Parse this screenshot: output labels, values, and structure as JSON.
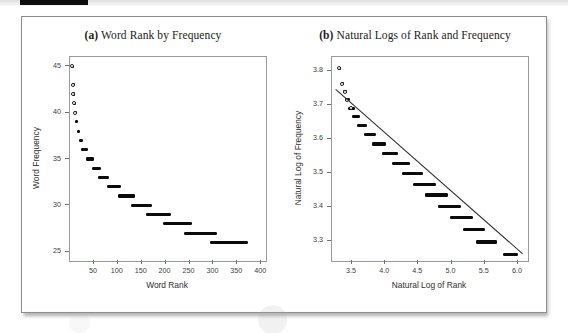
{
  "figure": {
    "panels": [
      {
        "tag": "(a)",
        "title": "Word Rank by Frequency"
      },
      {
        "tag": "(b)",
        "title": "Natural Logs of Rank and Frequency"
      }
    ]
  },
  "chart_data": [
    {
      "type": "scatter",
      "panel": "a",
      "title": "(a) Word Rank by Frequency",
      "xlabel": "Word Rank",
      "ylabel": "Word Frequency",
      "xlim": [
        0,
        410
      ],
      "ylim": [
        24,
        46
      ],
      "xticks": [
        50,
        100,
        150,
        200,
        250,
        300,
        350,
        400
      ],
      "xticklabels": [
        "50",
        "100",
        "150",
        "200",
        "250",
        "300",
        "350",
        "400"
      ],
      "yticks": [
        25,
        30,
        35,
        40,
        45
      ],
      "yticklabels": [
        "25",
        "30",
        "35",
        "40",
        "45"
      ],
      "grid": false,
      "legend": null,
      "marker": "circle",
      "series": [
        {
          "name": "Word rank vs frequency",
          "points": [
            {
              "x": 4,
              "y": 45,
              "open": true
            },
            {
              "x": 6,
              "y": 43,
              "open": true
            },
            {
              "x": 7,
              "y": 42,
              "open": true
            },
            {
              "x": 8,
              "y": 41,
              "open": true
            },
            {
              "x": 10,
              "y": 40,
              "open": true
            },
            {
              "x": 13,
              "y": 39,
              "open": false
            },
            {
              "x": 17,
              "y": 38,
              "open": false
            },
            {
              "x": 22,
              "y": 37,
              "open": false
            },
            {
              "x": 30,
              "y": 36,
              "open": false
            },
            {
              "x": 41,
              "y": 35,
              "open": false
            },
            {
              "x": 54,
              "y": 34,
              "open": false
            },
            {
              "x": 70,
              "y": 33,
              "open": false
            },
            {
              "x": 92,
              "y": 32,
              "open": false
            },
            {
              "x": 118,
              "y": 31,
              "open": false
            },
            {
              "x": 148,
              "y": 30,
              "open": false
            },
            {
              "x": 183,
              "y": 29,
              "open": false
            },
            {
              "x": 224,
              "y": 28,
              "open": false
            },
            {
              "x": 272,
              "y": 27,
              "open": false
            },
            {
              "x": 330,
              "y": 26,
              "open": false
            }
          ],
          "runs": [
            {
              "y": 45,
              "x_start": 3,
              "x_end": 5
            },
            {
              "y": 43,
              "x_start": 5,
              "x_end": 7
            },
            {
              "y": 42,
              "x_start": 6,
              "x_end": 8
            },
            {
              "y": 41,
              "x_start": 7,
              "x_end": 10
            },
            {
              "y": 40,
              "x_start": 9,
              "x_end": 12
            },
            {
              "y": 39,
              "x_start": 11,
              "x_end": 16
            },
            {
              "y": 38,
              "x_start": 14,
              "x_end": 21
            },
            {
              "y": 37,
              "x_start": 18,
              "x_end": 27
            },
            {
              "y": 36,
              "x_start": 24,
              "x_end": 37
            },
            {
              "y": 35,
              "x_start": 33,
              "x_end": 50
            },
            {
              "y": 34,
              "x_start": 45,
              "x_end": 64
            },
            {
              "y": 33,
              "x_start": 59,
              "x_end": 82
            },
            {
              "y": 32,
              "x_start": 77,
              "x_end": 107
            },
            {
              "y": 31,
              "x_start": 100,
              "x_end": 137
            },
            {
              "y": 30,
              "x_start": 127,
              "x_end": 172
            },
            {
              "y": 29,
              "x_start": 158,
              "x_end": 212
            },
            {
              "y": 28,
              "x_start": 195,
              "x_end": 256
            },
            {
              "y": 27,
              "x_start": 238,
              "x_end": 308
            },
            {
              "y": 26,
              "x_start": 292,
              "x_end": 372
            }
          ]
        }
      ]
    },
    {
      "type": "scatter",
      "panel": "b",
      "title": "(b) Natural Logs of Rank and Frequency",
      "xlabel": "Natural Log of Rank",
      "ylabel": "Natural Log of Frequency",
      "xlim": [
        3.2,
        6.15
      ],
      "ylim": [
        3.24,
        3.84
      ],
      "xticks": [
        3.5,
        4.0,
        4.5,
        5.0,
        5.5,
        6.0
      ],
      "xticklabels": [
        "3.5",
        "4.0",
        "4.5",
        "5.0",
        "5.5",
        "6.0"
      ],
      "yticks": [
        3.3,
        3.4,
        3.5,
        3.6,
        3.7,
        3.8
      ],
      "yticklabels": [
        "3.3",
        "3.4",
        "3.5",
        "3.6",
        "3.7",
        "3.8"
      ],
      "grid": false,
      "legend": null,
      "marker": "circle",
      "fit_line": {
        "name": "least-squares fit",
        "x_start": 3.26,
        "y_start": 3.745,
        "x_end": 6.07,
        "y_end": 3.262
      },
      "series": [
        {
          "name": "ln(rank) vs ln(frequency)",
          "runs": [
            {
              "y": 3.807,
              "x_start": 3.29,
              "x_end": 3.33
            },
            {
              "y": 3.761,
              "x_start": 3.33,
              "x_end": 3.38
            },
            {
              "y": 3.738,
              "x_start": 3.36,
              "x_end": 3.42
            },
            {
              "y": 3.714,
              "x_start": 3.4,
              "x_end": 3.47
            },
            {
              "y": 3.689,
              "x_start": 3.44,
              "x_end": 3.54
            },
            {
              "y": 3.664,
              "x_start": 3.5,
              "x_end": 3.62
            },
            {
              "y": 3.638,
              "x_start": 3.58,
              "x_end": 3.73
            },
            {
              "y": 3.611,
              "x_start": 3.68,
              "x_end": 3.86
            },
            {
              "y": 3.584,
              "x_start": 3.8,
              "x_end": 4.02
            },
            {
              "y": 3.555,
              "x_start": 3.95,
              "x_end": 4.2
            },
            {
              "y": 3.526,
              "x_start": 4.1,
              "x_end": 4.38
            },
            {
              "y": 3.497,
              "x_start": 4.26,
              "x_end": 4.57
            },
            {
              "y": 3.466,
              "x_start": 4.42,
              "x_end": 4.76
            },
            {
              "y": 3.434,
              "x_start": 4.6,
              "x_end": 4.95
            },
            {
              "y": 3.401,
              "x_start": 4.79,
              "x_end": 5.14
            },
            {
              "y": 3.367,
              "x_start": 4.98,
              "x_end": 5.32
            },
            {
              "y": 3.332,
              "x_start": 5.17,
              "x_end": 5.5
            },
            {
              "y": 3.296,
              "x_start": 5.36,
              "x_end": 5.68
            },
            {
              "y": 3.258,
              "x_start": 5.78,
              "x_end": 6.0
            }
          ],
          "points": [
            {
              "x": 3.3,
              "y": 3.807,
              "open": true
            },
            {
              "x": 3.35,
              "y": 3.761,
              "open": true
            },
            {
              "x": 3.39,
              "y": 3.738,
              "open": true
            },
            {
              "x": 3.43,
              "y": 3.714,
              "open": true
            },
            {
              "x": 3.49,
              "y": 3.689,
              "open": true
            }
          ]
        }
      ]
    }
  ]
}
